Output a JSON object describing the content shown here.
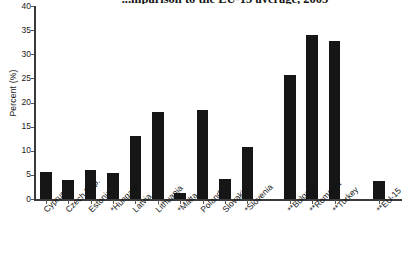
{
  "chart_data": {
    "type": "bar",
    "title": "...mparison to the EU-15 average, 2005",
    "xlabel": "",
    "ylabel": "Percent (%)",
    "ylim": [
      0,
      40
    ],
    "ytick_step": 5,
    "yticks": [
      "40",
      "35",
      "30",
      "25",
      "20",
      "15",
      "10",
      "5",
      "0"
    ],
    "grid": false,
    "legend": "none",
    "bar_color": "#161616",
    "categories": [
      "Cyprus",
      "Czech Rep.",
      "Estonia",
      "*Hungary",
      "Latvia",
      "Lithuania",
      "*Malta",
      "Poland",
      "Slovakia",
      "*Slovenia",
      "**Bulgaria",
      "**Romania",
      "**Turkey",
      "**EU-15"
    ],
    "values": [
      5.5,
      4.0,
      6.0,
      5.4,
      13.0,
      18.0,
      1.2,
      18.5,
      4.2,
      10.8,
      25.8,
      34.0,
      32.7,
      3.7
    ]
  }
}
